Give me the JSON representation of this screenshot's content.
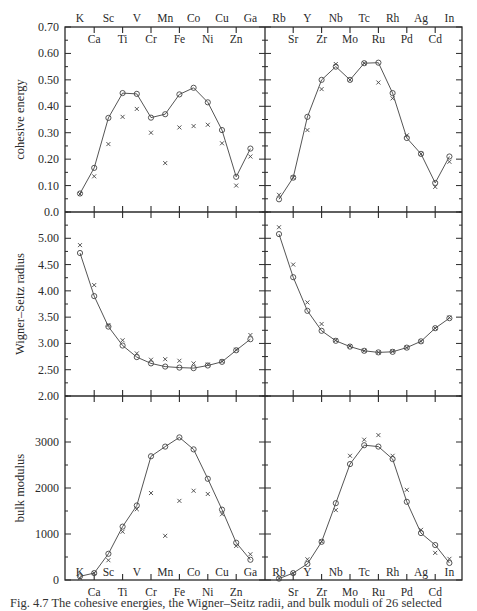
{
  "chart_data": [
    {
      "type": "line",
      "title": "",
      "panel": "upper-left",
      "ylabel": "cohesive energy",
      "xlabel": "",
      "ylim": [
        0.0,
        0.7
      ],
      "yticks": [
        "0.0",
        "0.10",
        "0.20",
        "0.30",
        "0.40",
        "0.50",
        "0.60",
        "0.70"
      ],
      "categories": [
        "K",
        "Ca",
        "Sc",
        "Ti",
        "V",
        "Cr",
        "Mn",
        "Fe",
        "Co",
        "Ni",
        "Cu",
        "Zn",
        "Ga"
      ],
      "series": [
        {
          "name": "calculated (circles, line)",
          "marker": "circle",
          "values": [
            0.07,
            0.167,
            0.356,
            0.45,
            0.447,
            0.357,
            0.37,
            0.445,
            0.47,
            0.415,
            0.31,
            0.133,
            0.24
          ]
        },
        {
          "name": "experimental (crosses)",
          "marker": "cross",
          "values": [
            0.068,
            0.135,
            0.257,
            0.36,
            0.39,
            0.3,
            0.185,
            0.32,
            0.325,
            0.33,
            0.26,
            0.1,
            0.21
          ]
        }
      ],
      "grid": false
    },
    {
      "type": "line",
      "panel": "upper-right",
      "ylabel": "",
      "ylim": [
        0.0,
        0.7
      ],
      "categories": [
        "Rb",
        "Sr",
        "Y",
        "Zr",
        "Nb",
        "Mo",
        "Tc",
        "Ru",
        "Rh",
        "Pd",
        "Ag",
        "Cd",
        "In"
      ],
      "series": [
        {
          "name": "calculated (circles, line)",
          "marker": "circle",
          "values": [
            0.048,
            0.13,
            0.36,
            0.5,
            0.55,
            0.5,
            0.563,
            0.565,
            0.45,
            0.28,
            0.22,
            0.11,
            0.21
          ]
        },
        {
          "name": "experimental (crosses)",
          "marker": "cross",
          "values": [
            0.065,
            0.13,
            0.31,
            0.465,
            0.56,
            0.5,
            0.563,
            0.49,
            0.43,
            0.29,
            0.22,
            0.095,
            0.19
          ]
        }
      ],
      "grid": false
    },
    {
      "type": "line",
      "panel": "middle-left",
      "ylabel": "Wigner–Seitz radius",
      "ylim": [
        2.0,
        5.5
      ],
      "yticks": [
        "2.00",
        "2.50",
        "3.00",
        "3.50",
        "4.00",
        "4.50",
        "5.00"
      ],
      "categories": [
        "K",
        "Ca",
        "Sc",
        "Ti",
        "V",
        "Cr",
        "Mn",
        "Fe",
        "Co",
        "Ni",
        "Cu",
        "Zn",
        "Ga"
      ],
      "series": [
        {
          "name": "calculated (circles, line)",
          "marker": "circle",
          "values": [
            4.72,
            3.9,
            3.32,
            2.96,
            2.74,
            2.62,
            2.56,
            2.54,
            2.53,
            2.58,
            2.65,
            2.87,
            3.08
          ]
        },
        {
          "name": "experimental (crosses)",
          "marker": "cross",
          "values": [
            4.87,
            4.11,
            3.35,
            3.06,
            2.81,
            2.69,
            2.7,
            2.67,
            2.62,
            2.6,
            2.66,
            2.88,
            3.16
          ]
        }
      ],
      "grid": false
    },
    {
      "type": "line",
      "panel": "middle-right",
      "ylim": [
        2.0,
        5.5
      ],
      "categories": [
        "Rb",
        "Sr",
        "Y",
        "Zr",
        "Nb",
        "Mo",
        "Tc",
        "Ru",
        "Rh",
        "Pd",
        "Ag",
        "Cd",
        "In"
      ],
      "series": [
        {
          "name": "calculated (circles, line)",
          "marker": "circle",
          "values": [
            5.08,
            4.26,
            3.62,
            3.24,
            3.05,
            2.94,
            2.86,
            2.83,
            2.84,
            2.92,
            3.04,
            3.29,
            3.48
          ]
        },
        {
          "name": "experimental (crosses)",
          "marker": "cross",
          "values": [
            5.21,
            4.5,
            3.78,
            3.37,
            3.06,
            2.95,
            2.86,
            2.83,
            2.85,
            2.92,
            3.04,
            3.29,
            3.49
          ]
        }
      ],
      "grid": false
    },
    {
      "type": "line",
      "panel": "lower-left",
      "ylabel": "bulk modulus",
      "ylim": [
        0,
        4000
      ],
      "yticks": [
        "0",
        "1000",
        "2000",
        "3000"
      ],
      "categories": [
        "K",
        "Ca",
        "Sc",
        "Ti",
        "V",
        "Cr",
        "Mn",
        "Fe",
        "Co",
        "Ni",
        "Cu",
        "Zn",
        "Ga"
      ],
      "series": [
        {
          "name": "calculated (circles, line)",
          "marker": "circle",
          "values": [
            80,
            150,
            570,
            1160,
            1620,
            2690,
            2900,
            3100,
            2840,
            2200,
            1530,
            810,
            440
          ]
        },
        {
          "name": "experimental (crosses)",
          "marker": "cross",
          "values": [
            40,
            150,
            430,
            1050,
            1540,
            1890,
            960,
            1720,
            1940,
            1870,
            1430,
            740,
            560
          ]
        }
      ],
      "grid": false
    },
    {
      "type": "line",
      "panel": "lower-right",
      "ylim": [
        0,
        4000
      ],
      "categories": [
        "Rb",
        "Sr",
        "Y",
        "Zr",
        "Nb",
        "Mo",
        "Tc",
        "Ru",
        "Rh",
        "Pd",
        "Ag",
        "Cd",
        "In"
      ],
      "series": [
        {
          "name": "calculated (circles, line)",
          "marker": "circle",
          "values": [
            30,
            150,
            350,
            830,
            1670,
            2520,
            2930,
            2900,
            2630,
            1700,
            1020,
            760,
            370
          ]
        },
        {
          "name": "experimental (crosses)",
          "marker": "cross",
          "values": [
            35,
            150,
            450,
            840,
            1520,
            2700,
            3050,
            3150,
            2700,
            1960,
            1090,
            590,
            460
          ]
        }
      ],
      "grid": false
    }
  ],
  "layout": {
    "plot_left": 65,
    "plot_mid": 265,
    "plot_right": 462,
    "panel_tops": [
      27,
      212,
      396
    ],
    "panel_bottoms": [
      212,
      396,
      580
    ],
    "elem_x0_left": 80,
    "elem_x0_right": 279,
    "elem_dx": 14.2
  },
  "axes": {
    "top_labels_upper_left": [
      "K",
      "Sc",
      "V",
      "Mn",
      "Co",
      "Cu",
      "Ga"
    ],
    "top_labels_lower_left": [
      "Ca",
      "Ti",
      "Cr",
      "Fe",
      "Ni",
      "Zn"
    ],
    "top_labels_upper_right": [
      "Rb",
      "Y",
      "Nb",
      "Tc",
      "Rh",
      "Ag",
      "In"
    ],
    "top_labels_lower_right": [
      "Sr",
      "Zr",
      "Mo",
      "Ru",
      "Pd",
      "Cd"
    ]
  },
  "caption": "Fig. 4.7 The cohesive energies, the Wigner–Seitz radii, and bulk moduli of 26 selected"
}
